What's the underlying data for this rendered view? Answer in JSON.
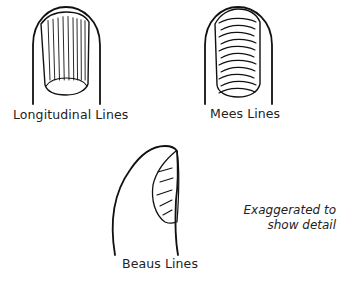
{
  "figure": {
    "panels": [
      {
        "id": "longitudinal",
        "label": "Longitudinal Lines",
        "nail_pattern": "vertical-ridges"
      },
      {
        "id": "mees",
        "label": "Mees Lines",
        "nail_pattern": "horizontal-bands"
      },
      {
        "id": "beaus",
        "label": "Beaus Lines",
        "nail_pattern": "transverse-depressions-side-view"
      }
    ],
    "note": {
      "line1": "Exaggerated to",
      "line2": "show detail"
    },
    "colors": {
      "ink": "#111111",
      "background": "#ffffff"
    }
  }
}
